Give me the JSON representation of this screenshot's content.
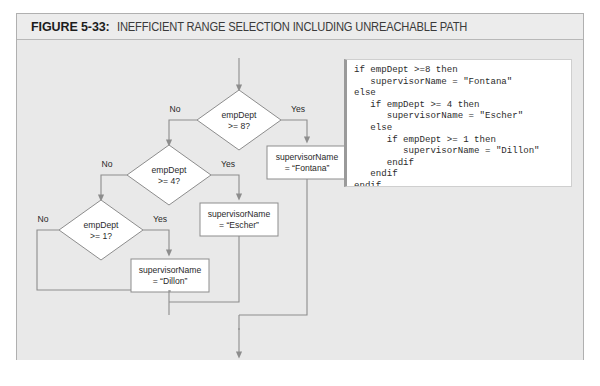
{
  "figure": {
    "label": "FIGURE 5-33:",
    "title": "INEFFICIENT RANGE SELECTION INCLUDING UNREACHABLE PATH"
  },
  "colors": {
    "panel_background": "#e9e9e9",
    "caption_background": "#ececec",
    "frame_border": "#b0b0b0",
    "shape_fill": "#ffffff",
    "shape_stroke": "#8d8d8d",
    "line_stroke": "#8d8d8d",
    "code_background": "#ffffff",
    "code_left_bar": "#9a9a9a",
    "text": "#2a2a2a"
  },
  "flowchart": {
    "decisions": [
      {
        "id": "dec8",
        "line1": "empDept",
        "line2": ">= 8?",
        "yes_label": "Yes",
        "no_label": "No"
      },
      {
        "id": "dec4",
        "line1": "empDept",
        "line2": ">= 4?",
        "yes_label": "Yes",
        "no_label": "No"
      },
      {
        "id": "dec1",
        "line1": "empDept",
        "line2": ">= 1?",
        "yes_label": "Yes",
        "no_label": "No"
      }
    ],
    "processes": [
      {
        "id": "fontana",
        "line1": "supervisorName",
        "line2": "= “Fontana”"
      },
      {
        "id": "escher",
        "line1": "supervisorName",
        "line2": "= “Escher”"
      },
      {
        "id": "dillon",
        "line1": "supervisorName",
        "line2": "= “Dillon”"
      }
    ]
  },
  "code": {
    "language": "pseudocode",
    "text": "if empDept >=8 then\n   supervisorName = \"Fontana\"\nelse\n   if empDept >= 4 then\n      supervisorName = \"Escher\"\n   else\n      if empDept >= 1 then\n         supervisorName = \"Dillon\"\n      endif\n   endif\nendif",
    "lines": [
      "if empDept >=8 then",
      "   supervisorName = \"Fontana\"",
      "else",
      "   if empDept >= 4 then",
      "      supervisorName = \"Escher\"",
      "   else",
      "      if empDept >= 1 then",
      "         supervisorName = \"Dillon\"",
      "      endif",
      "   endif",
      "endif"
    ]
  }
}
